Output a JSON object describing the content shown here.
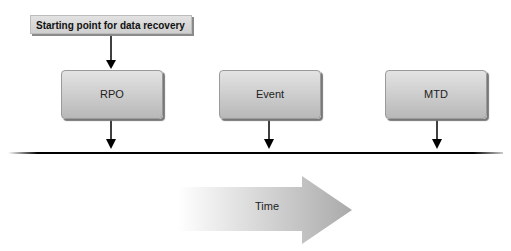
{
  "diagram": {
    "start_label": "Starting point for data recovery",
    "boxes": [
      {
        "label": "RPO"
      },
      {
        "label": "Event"
      },
      {
        "label": "MTD"
      }
    ],
    "arrow_label": "Time"
  }
}
